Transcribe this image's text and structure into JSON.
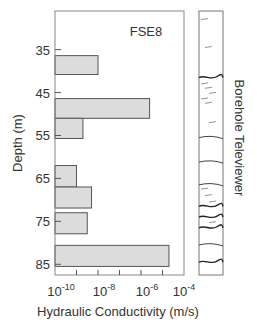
{
  "chart_data": {
    "type": "bar",
    "orientation": "horizontal",
    "title": "FSE8",
    "xlabel": "Hydraulic Conductivity (m/s)",
    "ylabel": "Depth (m)",
    "xscale": "log",
    "xlim_exp": [
      -10,
      -4
    ],
    "ylim": [
      26,
      87.5
    ],
    "y_inverted": true,
    "grid": false,
    "x_ticks": [
      {
        "base": "10",
        "exp": "-10",
        "value_exp": -10
      },
      {
        "base": "10",
        "exp": "-8",
        "value_exp": -8
      },
      {
        "base": "10",
        "exp": "-6",
        "value_exp": -6
      },
      {
        "base": "10",
        "exp": "-4",
        "value_exp": -4
      }
    ],
    "x_minor_ticks_exp": [
      -9,
      -8,
      -7,
      -6,
      -5
    ],
    "y_ticks": [
      "35",
      "45",
      "55",
      "65",
      "75",
      "85"
    ],
    "bars": [
      {
        "depth_top": 36.4,
        "depth_bottom": 40.8,
        "log10_K": -8.0
      },
      {
        "depth_top": 46.4,
        "depth_bottom": 51.0,
        "log10_K": -5.6
      },
      {
        "depth_top": 51.0,
        "depth_bottom": 55.7,
        "log10_K": -8.7
      },
      {
        "depth_top": 62.0,
        "depth_bottom": 67.0,
        "log10_K": -9.0
      },
      {
        "depth_top": 67.0,
        "depth_bottom": 71.9,
        "log10_K": -8.3
      },
      {
        "depth_top": 73.0,
        "depth_bottom": 77.9,
        "log10_K": -8.5
      },
      {
        "depth_top": 80.6,
        "depth_bottom": 85.5,
        "log10_K": -4.7
      }
    ],
    "bar_fill": "#dcdcdc",
    "bar_stroke": "#555555",
    "televiewer": {
      "label": "Borehole Televiewer",
      "features": [
        {
          "depth": 28.0,
          "kind": "faint"
        },
        {
          "depth": 34.5,
          "kind": "faint"
        },
        {
          "depth": 41.5,
          "kind": "strong"
        },
        {
          "depth": 43.0,
          "kind": "faint"
        },
        {
          "depth": 44.0,
          "kind": "faint"
        },
        {
          "depth": 45.2,
          "kind": "faint"
        },
        {
          "depth": 46.5,
          "kind": "faint"
        },
        {
          "depth": 47.5,
          "kind": "faint"
        },
        {
          "depth": 52.0,
          "kind": "faint"
        },
        {
          "depth": 55.5,
          "kind": "medium"
        },
        {
          "depth": 61.2,
          "kind": "medium"
        },
        {
          "depth": 66.5,
          "kind": "medium"
        },
        {
          "depth": 67.5,
          "kind": "faint"
        },
        {
          "depth": 69.0,
          "kind": "faint"
        },
        {
          "depth": 70.5,
          "kind": "faint"
        },
        {
          "depth": 71.5,
          "kind": "strong"
        },
        {
          "depth": 74.0,
          "kind": "strong"
        },
        {
          "depth": 75.3,
          "kind": "faint"
        },
        {
          "depth": 76.5,
          "kind": "strong"
        },
        {
          "depth": 80.5,
          "kind": "medium"
        },
        {
          "depth": 84.5,
          "kind": "strong"
        }
      ]
    }
  }
}
